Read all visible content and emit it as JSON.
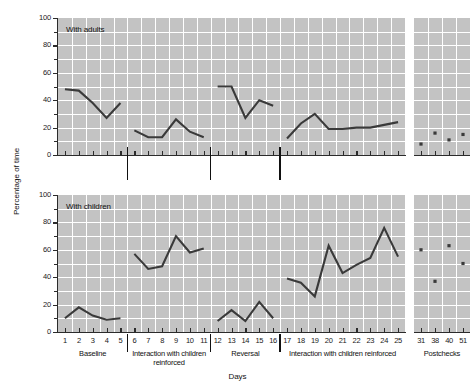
{
  "chart_data": {
    "type": "line",
    "title": "",
    "xlabel": "Days",
    "ylabel": "Percentage of time",
    "ylim": [
      0,
      100
    ],
    "yticks": [
      0,
      20,
      40,
      60,
      80,
      100
    ],
    "grid": true,
    "legend": "none",
    "panels": [
      {
        "name": "top-panel",
        "label": "With adults",
        "segments": [
          {
            "phase": "Baseline",
            "x": [
              1,
              2,
              3,
              4,
              5
            ],
            "y": [
              48,
              47,
              38,
              27,
              38
            ],
            "style": "line"
          },
          {
            "phase": "Interaction with children reinforced",
            "x": [
              6,
              7,
              8,
              9,
              10,
              11
            ],
            "y": [
              18,
              13,
              13,
              26,
              17,
              13
            ],
            "style": "line"
          },
          {
            "phase": "Reversal",
            "x": [
              12,
              13,
              14,
              15,
              16
            ],
            "y": [
              50,
              50,
              27,
              40,
              36
            ],
            "style": "line"
          },
          {
            "phase": "Interaction with children reinforced",
            "x": [
              17,
              18,
              19,
              20,
              21,
              22,
              23,
              24,
              25
            ],
            "y": [
              12,
              23,
              30,
              19,
              19,
              20,
              20,
              22,
              24
            ],
            "style": "line"
          },
          {
            "phase": "Postchecks",
            "x": [
              31,
              38,
              40,
              51
            ],
            "y": [
              8,
              16,
              11,
              15
            ],
            "style": "points"
          }
        ]
      },
      {
        "name": "bottom-panel",
        "label": "With children",
        "segments": [
          {
            "phase": "Baseline",
            "x": [
              1,
              2,
              3,
              4,
              5
            ],
            "y": [
              10,
              18,
              12,
              9,
              10
            ],
            "style": "line"
          },
          {
            "phase": "Interaction with children reinforced",
            "x": [
              6,
              7,
              8,
              9,
              10,
              11
            ],
            "y": [
              57,
              46,
              48,
              70,
              58,
              61
            ],
            "style": "line"
          },
          {
            "phase": "Reversal",
            "x": [
              12,
              13,
              14,
              15,
              16
            ],
            "y": [
              8,
              16,
              8,
              22,
              10
            ],
            "style": "line"
          },
          {
            "phase": "Interaction with children reinforced",
            "x": [
              17,
              18,
              19,
              20,
              21,
              22,
              23,
              24,
              25
            ],
            "y": [
              39,
              36,
              26,
              63,
              43,
              49,
              54,
              76,
              55
            ],
            "style": "line"
          },
          {
            "phase": "Postchecks",
            "x": [
              31,
              38,
              40,
              51
            ],
            "y": [
              60,
              37,
              63,
              50
            ],
            "style": "points"
          }
        ]
      }
    ],
    "xtick_labels_main": [
      "1",
      "2",
      "3",
      "4",
      "5",
      "6",
      "7",
      "8",
      "9",
      "10",
      "11",
      "12",
      "13",
      "14",
      "15",
      "16",
      "17",
      "18",
      "19",
      "20",
      "21",
      "22",
      "23",
      "24",
      "25"
    ],
    "xtick_labels_post": [
      "31",
      "38",
      "40",
      "51"
    ],
    "phase_labels": [
      {
        "text": "Baseline",
        "days": [
          1,
          5
        ]
      },
      {
        "text": "Interaction with children reinforced",
        "days": [
          6,
          11
        ]
      },
      {
        "text": "Reversal",
        "days": [
          12,
          16
        ]
      },
      {
        "text": "Interaction with children reinforced",
        "days": [
          17,
          25
        ]
      },
      {
        "text": "Postchecks",
        "days": [
          31,
          51
        ]
      }
    ],
    "phase_dividers_after_day": [
      5,
      11,
      16
    ],
    "colors": {
      "plot_background": "#c3c3c3",
      "gridline": "#ffffff",
      "data_line": "#3a3a3a",
      "axis": "#2b2b2b",
      "text": "#1a1a1a"
    }
  }
}
